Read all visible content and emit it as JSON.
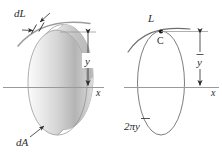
{
  "figure": {
    "background_color": "#ffffff",
    "ink_color": "#2b2b2b",
    "axis_color": "#9a9a9a",
    "band_fill_light": "#f2f2f2",
    "band_fill_dark": "#b9b9b9"
  },
  "left_figure": {
    "name": "ring-generated-by-revolving-dL",
    "labels": {
      "dL": "dL",
      "dA": "dA",
      "y": "y",
      "x": "x"
    },
    "elements": {
      "band": "revolved-ribbon",
      "curve": "generating-curve-arc",
      "dimension": "y-dimension-double-arrow",
      "axis": "x-axis-line"
    }
  },
  "right_figure": {
    "name": "curve-L-with-centroid-C",
    "labels": {
      "L": "L",
      "C": "C",
      "y_bar": "y",
      "y_bar_overline": "̄",
      "circumference": "2πy",
      "x": "x"
    },
    "elements": {
      "ellipse": "path-of-centroid-ellipse",
      "curve": "curve-L-arc",
      "centroid_point": "centroid-dot",
      "dimension": "y-bar-dimension-double-arrow",
      "axis": "x-axis-line"
    }
  }
}
